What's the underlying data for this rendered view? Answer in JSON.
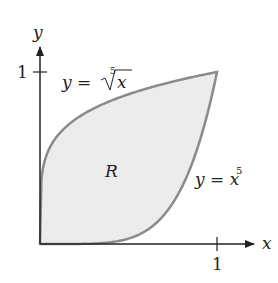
{
  "diagram": {
    "axes": {
      "x_label": "x",
      "y_label": "y",
      "x_tick": "1",
      "y_tick": "1"
    },
    "curves": [
      {
        "name": "fifth-root",
        "label_lhs": "y = ",
        "label_root_index": "5",
        "label_radicand": "x"
      },
      {
        "name": "fifth-power",
        "label_lhs": "y = x",
        "label_exponent": "5"
      }
    ],
    "region": {
      "label": "R",
      "fill": "#ececec",
      "stroke": "#8a8a8a"
    }
  }
}
